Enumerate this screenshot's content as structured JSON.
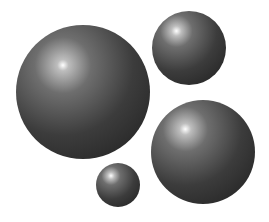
{
  "scene": {
    "description": "Four glossy dark grey spheres on a white background",
    "background": "#ffffff",
    "colors": {
      "highlight": "#ffffff",
      "mid": "#6e6e6e",
      "body": "#3c3c3c",
      "edge": "#1e1e1e"
    },
    "spheres": [
      {
        "name": "large-sphere",
        "cx": 83,
        "cy": 92,
        "r": 67,
        "hx": 35,
        "hy": 30
      },
      {
        "name": "top-right-sphere",
        "cx": 189,
        "cy": 48,
        "r": 37,
        "hx": 33,
        "hy": 27
      },
      {
        "name": "bottom-right-sphere",
        "cx": 203,
        "cy": 152,
        "r": 52,
        "hx": 33,
        "hy": 28
      },
      {
        "name": "small-sphere",
        "cx": 118,
        "cy": 185,
        "r": 22,
        "hx": 34,
        "hy": 29
      }
    ]
  }
}
